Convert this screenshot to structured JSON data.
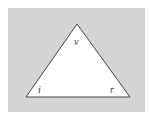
{
  "diagram": {
    "type": "triangle",
    "background_color": "#d4d4d4",
    "fill_color": "#ffffff",
    "stroke_color": "#444444",
    "vertices": {
      "top": {
        "x": 77,
        "y": 24,
        "label": "v"
      },
      "bottom_left": {
        "x": 26,
        "y": 97,
        "label": "i"
      },
      "bottom_right": {
        "x": 130,
        "y": 97,
        "label": "r"
      }
    }
  }
}
